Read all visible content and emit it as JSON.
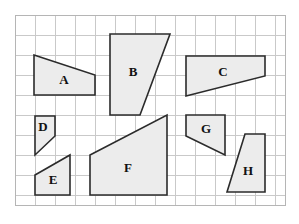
{
  "figure": {
    "background_color": "#ffffff",
    "shape_fill_color": "#ececec",
    "shape_stroke_color": "#2b2b2b",
    "grid_line_color": "#c9c9c9",
    "grid_border_color": "#b5b5b5"
  },
  "grid": {
    "x": 15,
    "y": 15,
    "width": 270,
    "height": 190,
    "cell_size": 20,
    "columns": 13,
    "rows": 9,
    "vertical_lines": [
      35,
      55,
      75,
      95,
      115,
      135,
      155,
      175,
      195,
      215,
      235,
      255,
      275
    ],
    "horizontal_lines": [
      35,
      55,
      75,
      95,
      115,
      135,
      155,
      175,
      195
    ]
  },
  "shapes": [
    {
      "label": "A",
      "points": "34,55 95,75 95,95 34,95",
      "label_x": 64,
      "label_y": 81
    },
    {
      "label": "B",
      "points": "110,34 170,34 140,115 110,115",
      "label_x": 133,
      "label_y": 73
    },
    {
      "label": "C",
      "points": "186,56 265,56 265,76 186,96",
      "label_x": 223,
      "label_y": 73
    },
    {
      "label": "D",
      "points": "35,116 55,116 55,136 35,155",
      "label_x": 43,
      "label_y": 128
    },
    {
      "label": "E",
      "points": "35,175 70,155 70,195 35,195",
      "label_x": 53,
      "label_y": 181
    },
    {
      "label": "F",
      "points": "90,155 167,115 167,195 90,195",
      "label_x": 128,
      "label_y": 169
    },
    {
      "label": "G",
      "points": "186,115 225,115 225,155 186,136",
      "label_x": 206,
      "label_y": 130
    },
    {
      "label": "H",
      "points": "245,134 265,134 265,192 227,192",
      "label_x": 248,
      "label_y": 172
    }
  ]
}
